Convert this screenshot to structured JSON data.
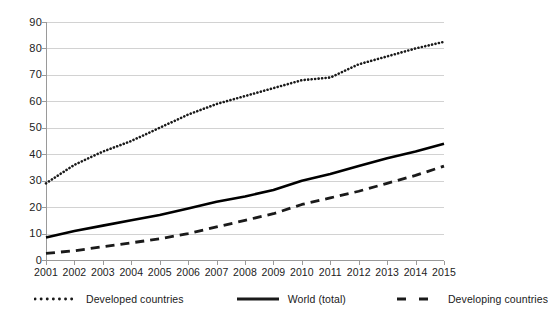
{
  "chart_data": {
    "type": "line",
    "title": "",
    "subtitle": "",
    "xlabel": "",
    "ylabel": "",
    "categories": [
      "2001",
      "2002",
      "2003",
      "2004",
      "2005",
      "2006",
      "2007",
      "2008",
      "2009",
      "2010",
      "2011",
      "2012",
      "2013",
      "2014",
      "2015"
    ],
    "x": [
      2001,
      2002,
      2003,
      2004,
      2005,
      2006,
      2007,
      2008,
      2009,
      2010,
      2011,
      2012,
      2013,
      2014,
      2015
    ],
    "xlim": [
      2001,
      2015
    ],
    "ylim": [
      0,
      90
    ],
    "yticks": [
      0,
      10,
      20,
      30,
      40,
      50,
      60,
      70,
      80,
      90
    ],
    "ytick_labels": [
      "0",
      "10",
      "20",
      "30",
      "40",
      "50",
      "60",
      "70",
      "80",
      "90"
    ],
    "grid": true,
    "grid_axis": "y",
    "legend_position": "bottom",
    "series": [
      {
        "name": "Developed countries",
        "style": "dotted",
        "color": "#1a1a1a",
        "values": [
          29,
          36,
          41,
          45,
          50,
          55,
          59,
          62,
          65,
          68,
          69,
          74,
          77,
          80,
          82.5
        ]
      },
      {
        "name": "World (total)",
        "style": "solid",
        "color": "#000000",
        "values": [
          8.5,
          11,
          13,
          15,
          17,
          19.5,
          22,
          24,
          26.5,
          30,
          32.5,
          35.5,
          38.5,
          41,
          44
        ]
      },
      {
        "name": "Developing countries",
        "style": "dashed",
        "color": "#1a1a1a",
        "values": [
          2.5,
          3.5,
          5,
          6.5,
          8,
          10,
          12.5,
          15,
          17.5,
          21,
          23.5,
          26,
          29,
          32,
          35.5
        ]
      }
    ]
  },
  "legend": {
    "items": [
      {
        "label": "Developed countries",
        "style": "dotted"
      },
      {
        "label": "World (total)",
        "style": "solid"
      },
      {
        "label": "Developing countries",
        "style": "dashed"
      }
    ]
  },
  "axes": {
    "y_tick_labels": [
      "90",
      "80",
      "70",
      "60",
      "50",
      "40",
      "30",
      "20",
      "10",
      "0"
    ],
    "x_tick_labels": [
      "2001",
      "2002",
      "2003",
      "2004",
      "2005",
      "2006",
      "2007",
      "2008",
      "2009",
      "2010",
      "2011",
      "2012",
      "2013",
      "2014",
      "2015"
    ]
  }
}
